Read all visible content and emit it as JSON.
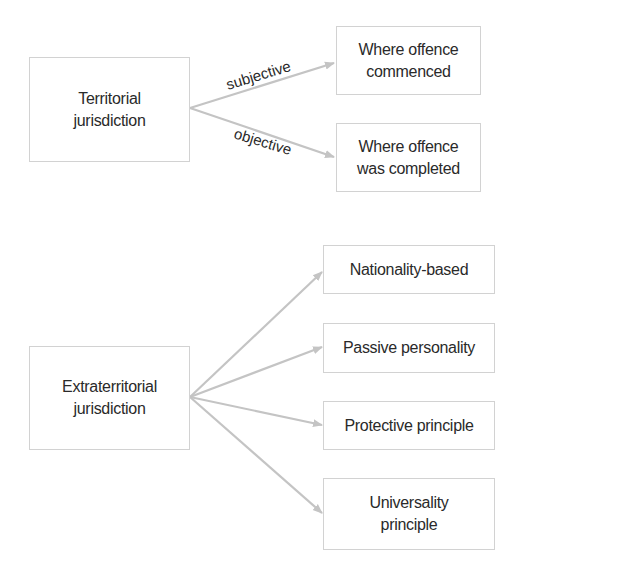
{
  "diagram": {
    "territorial": {
      "root": "Territorial\njurisdiction",
      "edges": [
        {
          "label": "subjective",
          "target": "Where offence commenced"
        },
        {
          "label": "objective",
          "target": "Where offence was completed"
        }
      ],
      "targets": [
        "Where offence\ncommenced",
        "Where offence\nwas completed"
      ]
    },
    "extraterritorial": {
      "root": "Extraterritorial\njurisdiction",
      "targets": [
        "Nationality-based",
        "Passive personality",
        "Protective principle",
        "Universality\nprinciple"
      ]
    },
    "colors": {
      "arrow": "#c4c4c4",
      "border": "#d2d2d2",
      "text": "#2a2a2a"
    }
  }
}
